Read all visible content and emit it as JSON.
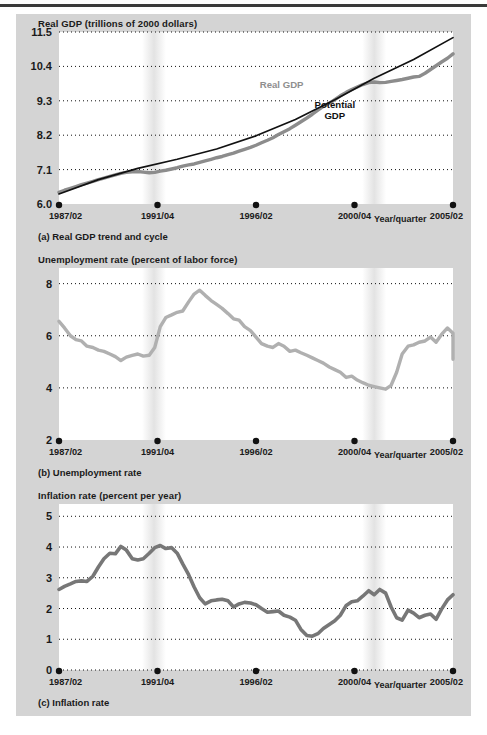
{
  "figure": {
    "background_color": "#d4d4d4",
    "plot_background_color": "#ffffff",
    "recession_band_color": "#e3e3e3",
    "axis_label_suffix": "Year/quarter"
  },
  "panels": [
    {
      "key": "a",
      "caption": "(a) Real GDP trend and cycle",
      "axis_title": "Real GDP (trillions of 2000 dollars)",
      "xaxis_note": "Year/quarter"
    },
    {
      "key": "b",
      "caption": "(b) Unemployment rate",
      "axis_title": "Unemployment rate (percent of labor force)",
      "xaxis_note": "Year/quarter"
    },
    {
      "key": "c",
      "caption": "(c) Inflation rate",
      "axis_title": "Inflation rate (percent per year)",
      "xaxis_note": "Year/quarter"
    }
  ],
  "chart_data": [
    {
      "id": "real-gdp",
      "type": "line",
      "title": "Real GDP (trillions of 2000 dollars)",
      "subtitle": "(a) Real GDP trend and cycle",
      "xlabel": "Year/quarter",
      "ylabel": "Real GDP (trillions of 2000 dollars)",
      "grid": true,
      "legend": "inline-annotation",
      "ylim": [
        6.0,
        11.5
      ],
      "yticks": [
        "11.5",
        "10.4",
        "9.3",
        "8.2",
        "7.1",
        "6.0"
      ],
      "ytick_values": [
        11.5,
        10.4,
        9.3,
        8.2,
        7.1,
        6.0
      ],
      "xticks": [
        "1987/02",
        "1991/04",
        "1996/02",
        "2000/04",
        "2005/02"
      ],
      "xtick_positions": [
        0.0,
        0.25,
        0.5,
        0.75,
        1.0
      ],
      "xlim": [
        0,
        1
      ],
      "recessions": [
        {
          "start": 0.2235,
          "end": 0.2588
        },
        {
          "start": 0.7824,
          "end": 0.8176
        }
      ],
      "series": [
        {
          "name": "Real GDP",
          "color": "#8c8c8c",
          "label_color": "#8f8f8f",
          "width": 3.4,
          "annotation": {
            "text": "Real GDP",
            "x": 0.565,
            "y": 9.72
          },
          "x": [
            0.0,
            0.014,
            0.029,
            0.043,
            0.057,
            0.071,
            0.086,
            0.1,
            0.114,
            0.129,
            0.143,
            0.157,
            0.171,
            0.186,
            0.2,
            0.214,
            0.229,
            0.243,
            0.257,
            0.271,
            0.286,
            0.3,
            0.314,
            0.329,
            0.343,
            0.357,
            0.371,
            0.386,
            0.4,
            0.414,
            0.429,
            0.443,
            0.457,
            0.471,
            0.486,
            0.5,
            0.514,
            0.529,
            0.543,
            0.557,
            0.571,
            0.586,
            0.6,
            0.614,
            0.629,
            0.643,
            0.657,
            0.671,
            0.686,
            0.7,
            0.714,
            0.729,
            0.743,
            0.757,
            0.771,
            0.786,
            0.8,
            0.814,
            0.829,
            0.843,
            0.857,
            0.871,
            0.886,
            0.9,
            0.914,
            0.929,
            0.943,
            0.957,
            0.971,
            0.986,
            1.0
          ],
          "y": [
            6.37,
            6.44,
            6.5,
            6.56,
            6.62,
            6.67,
            6.72,
            6.78,
            6.83,
            6.88,
            6.93,
            6.98,
            7.01,
            7.03,
            7.04,
            7.02,
            7.0,
            7.01,
            7.05,
            7.08,
            7.12,
            7.16,
            7.21,
            7.25,
            7.28,
            7.33,
            7.38,
            7.43,
            7.48,
            7.52,
            7.58,
            7.63,
            7.69,
            7.75,
            7.81,
            7.88,
            7.96,
            8.04,
            8.12,
            8.22,
            8.31,
            8.41,
            8.52,
            8.63,
            8.75,
            8.87,
            9.0,
            9.12,
            9.22,
            9.34,
            9.46,
            9.57,
            9.66,
            9.74,
            9.82,
            9.88,
            9.9,
            9.88,
            9.89,
            9.92,
            9.95,
            9.98,
            10.02,
            10.06,
            10.08,
            10.18,
            10.3,
            10.42,
            10.54,
            10.66,
            10.8
          ]
        },
        {
          "name": "Potential GDP",
          "color": "#111111",
          "label_color": "#111111",
          "width": 1.7,
          "annotation": {
            "text": "Potential\nGDP",
            "x": 0.7,
            "y": 9.06
          },
          "x": [
            0.0,
            0.1,
            0.2,
            0.3,
            0.4,
            0.5,
            0.6,
            0.7,
            0.8,
            0.9,
            1.0
          ],
          "y": [
            6.32,
            6.78,
            7.14,
            7.43,
            7.76,
            8.18,
            8.7,
            9.33,
            10.02,
            10.62,
            11.32
          ]
        }
      ]
    },
    {
      "id": "unemployment-rate",
      "type": "line",
      "title": "Unemployment rate (percent of labor force)",
      "subtitle": "(b) Unemployment rate",
      "xlabel": "Year/quarter",
      "ylabel": "Unemployment rate (percent of labor force)",
      "grid": true,
      "ylim": [
        2,
        8.6
      ],
      "yticks": [
        "8",
        "6",
        "4",
        "2"
      ],
      "ytick_values": [
        8,
        6,
        4,
        2
      ],
      "xticks": [
        "1987/02",
        "1991/04",
        "1996/02",
        "2000/04",
        "2005/02"
      ],
      "xtick_positions": [
        0.0,
        0.25,
        0.5,
        0.75,
        1.0
      ],
      "xlim": [
        0,
        1
      ],
      "recessions": [
        {
          "start": 0.2235,
          "end": 0.2588
        },
        {
          "start": 0.7824,
          "end": 0.8176
        }
      ],
      "series": [
        {
          "name": "Unemployment rate",
          "color": "#b0b0b0",
          "width": 3.4,
          "x": [
            0.0,
            0.014,
            0.029,
            0.043,
            0.057,
            0.071,
            0.086,
            0.1,
            0.114,
            0.129,
            0.143,
            0.157,
            0.171,
            0.186,
            0.2,
            0.214,
            0.229,
            0.243,
            0.257,
            0.271,
            0.286,
            0.3,
            0.314,
            0.329,
            0.343,
            0.357,
            0.371,
            0.386,
            0.4,
            0.414,
            0.429,
            0.443,
            0.457,
            0.471,
            0.486,
            0.5,
            0.514,
            0.529,
            0.543,
            0.557,
            0.571,
            0.586,
            0.6,
            0.614,
            0.629,
            0.643,
            0.657,
            0.671,
            0.686,
            0.7,
            0.714,
            0.729,
            0.743,
            0.757,
            0.771,
            0.786,
            0.8,
            0.814,
            0.829,
            0.843,
            0.857,
            0.871,
            0.886,
            0.9,
            0.914,
            0.929,
            0.943,
            0.957,
            0.971,
            0.986,
            1.0
          ],
          "y": [
            6.55,
            6.3,
            6.0,
            5.85,
            5.8,
            5.6,
            5.55,
            5.45,
            5.4,
            5.3,
            5.2,
            5.05,
            5.18,
            5.25,
            5.3,
            5.22,
            5.25,
            5.55,
            6.35,
            6.7,
            6.8,
            6.9,
            6.95,
            7.3,
            7.6,
            7.75,
            7.55,
            7.35,
            7.2,
            7.05,
            6.85,
            6.65,
            6.6,
            6.35,
            6.2,
            5.95,
            5.7,
            5.6,
            5.55,
            5.7,
            5.6,
            5.4,
            5.45,
            5.35,
            5.25,
            5.15,
            5.05,
            4.95,
            4.8,
            4.7,
            4.6,
            4.4,
            4.45,
            4.3,
            4.2,
            4.1,
            4.05,
            4.0,
            3.95,
            4.1,
            4.6,
            5.3,
            5.6,
            5.65,
            5.75,
            5.8,
            5.95,
            5.75,
            6.05,
            6.3,
            6.1
          ],
          "tail_x": [
            1.0,
            1.0
          ],
          "tail_y": [
            6.1,
            5.1
          ]
        }
      ]
    },
    {
      "id": "inflation-rate",
      "type": "line",
      "title": "Inflation rate (percent per year)",
      "subtitle": "(c) Inflation rate",
      "xlabel": "Year/quarter",
      "ylabel": "Inflation rate (percent per year)",
      "grid": true,
      "ylim": [
        0,
        5.4
      ],
      "yticks": [
        "5",
        "4",
        "3",
        "2",
        "1",
        "0"
      ],
      "ytick_values": [
        5,
        4,
        3,
        2,
        1,
        0
      ],
      "xticks": [
        "1987/02",
        "1991/04",
        "1996/02",
        "2000/04",
        "2005/02"
      ],
      "xtick_positions": [
        0.0,
        0.25,
        0.5,
        0.75,
        1.0
      ],
      "xlim": [
        0,
        1
      ],
      "recessions": [
        {
          "start": 0.2235,
          "end": 0.2588
        },
        {
          "start": 0.7824,
          "end": 0.8176
        }
      ],
      "series": [
        {
          "name": "Inflation rate",
          "color": "#777777",
          "width": 3.6,
          "x": [
            0.0,
            0.014,
            0.029,
            0.043,
            0.057,
            0.071,
            0.086,
            0.1,
            0.114,
            0.129,
            0.143,
            0.157,
            0.171,
            0.186,
            0.2,
            0.214,
            0.229,
            0.243,
            0.257,
            0.271,
            0.286,
            0.3,
            0.314,
            0.329,
            0.343,
            0.357,
            0.371,
            0.386,
            0.4,
            0.414,
            0.429,
            0.443,
            0.457,
            0.471,
            0.486,
            0.5,
            0.514,
            0.529,
            0.543,
            0.557,
            0.571,
            0.586,
            0.6,
            0.614,
            0.629,
            0.643,
            0.657,
            0.671,
            0.686,
            0.7,
            0.714,
            0.729,
            0.743,
            0.757,
            0.771,
            0.786,
            0.8,
            0.814,
            0.829,
            0.843,
            0.857,
            0.871,
            0.886,
            0.9,
            0.914,
            0.929,
            0.943,
            0.957,
            0.971,
            0.986,
            1.0
          ],
          "y": [
            2.62,
            2.72,
            2.8,
            2.88,
            2.9,
            2.88,
            3.05,
            3.35,
            3.62,
            3.8,
            3.78,
            4.02,
            3.9,
            3.62,
            3.58,
            3.62,
            3.8,
            3.98,
            4.05,
            3.95,
            3.98,
            3.8,
            3.45,
            3.1,
            2.7,
            2.35,
            2.15,
            2.25,
            2.28,
            2.3,
            2.25,
            2.05,
            2.15,
            2.2,
            2.18,
            2.12,
            2.0,
            1.88,
            1.9,
            1.92,
            1.78,
            1.72,
            1.62,
            1.32,
            1.12,
            1.1,
            1.18,
            1.35,
            1.48,
            1.6,
            1.78,
            2.1,
            2.22,
            2.25,
            2.4,
            2.58,
            2.45,
            2.62,
            2.5,
            2.05,
            1.7,
            1.62,
            1.95,
            1.85,
            1.7,
            1.78,
            1.82,
            1.65,
            1.98,
            2.28,
            2.45
          ]
        }
      ]
    }
  ]
}
